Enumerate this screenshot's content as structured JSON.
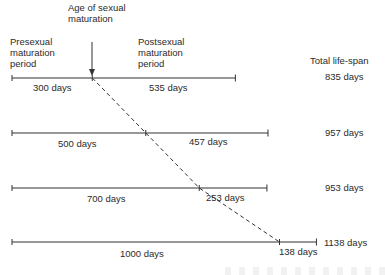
{
  "annotations": {
    "maturation_arrow_label": "Age of sexual\nmaturation",
    "presexual_label": "Presexual\nmaturation\nperiod",
    "postsexual_label": "Postsexual\nmaturation\nperiod",
    "total_header": "Total life-span"
  },
  "rows": [
    {
      "presexual": "300 days",
      "postsexual": "535 days",
      "total": "835 days",
      "pre_days": 300,
      "post_days": 535
    },
    {
      "presexual": "500 days",
      "postsexual": "457 days",
      "total": "957 days",
      "pre_days": 500,
      "post_days": 457
    },
    {
      "presexual": "700 days",
      "postsexual": "253 days",
      "total": "953 days",
      "pre_days": 700,
      "post_days": 253
    },
    {
      "presexual": "1000 days",
      "postsexual": "138 days",
      "total": "1138 days",
      "pre_days": 1000,
      "post_days": 138
    }
  ]
}
